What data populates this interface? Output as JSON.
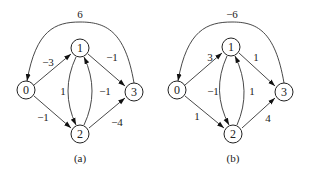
{
  "figures": [
    {
      "caption": "(a)",
      "nodes": [
        "0",
        "1",
        "2",
        "3"
      ],
      "edges": [
        {
          "from": "0",
          "to": "1",
          "weight": "−3"
        },
        {
          "from": "0",
          "to": "2",
          "weight": "−1"
        },
        {
          "from": "1",
          "to": "3",
          "weight": "−1"
        },
        {
          "from": "2",
          "to": "3",
          "weight": "−4"
        },
        {
          "from": "1",
          "to": "2",
          "weight": "1"
        },
        {
          "from": "2",
          "to": "1",
          "weight": "−1"
        },
        {
          "from": "3",
          "to": "0",
          "weight": "6"
        }
      ]
    },
    {
      "caption": "(b)",
      "nodes": [
        "0",
        "1",
        "2",
        "3"
      ],
      "edges": [
        {
          "from": "0",
          "to": "1",
          "weight": "3"
        },
        {
          "from": "0",
          "to": "2",
          "weight": "1"
        },
        {
          "from": "1",
          "to": "3",
          "weight": "1"
        },
        {
          "from": "2",
          "to": "3",
          "weight": "4"
        },
        {
          "from": "1",
          "to": "2",
          "weight": "−1"
        },
        {
          "from": "2",
          "to": "1",
          "weight": "1"
        },
        {
          "from": "3",
          "to": "0",
          "weight": "−6"
        }
      ]
    }
  ]
}
